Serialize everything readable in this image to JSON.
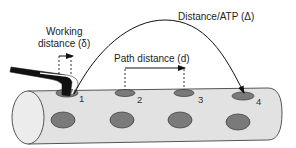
{
  "labels": {
    "working_distance_line1": "Working",
    "working_distance_line2": "distance (δ)",
    "path_distance": "Path distance (d)",
    "distance_atp": "Distance/ATP (Δ)"
  },
  "sites": [
    {
      "label": "1",
      "role": "current binding site (tool engaged)"
    },
    {
      "label": "2",
      "role": "binding site"
    },
    {
      "label": "3",
      "role": "binding site"
    },
    {
      "label": "4",
      "role": "target binding site"
    }
  ],
  "colors": {
    "cylinder_fill": "#e2e2e2",
    "cylinder_stroke": "#555555",
    "hole_fill": "#7a7a7a",
    "hole_stroke": "#444444",
    "tool_fill": "#111111",
    "line": "#111111"
  }
}
